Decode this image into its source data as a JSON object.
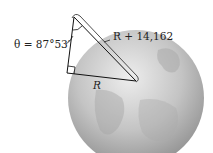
{
  "diagram": {
    "angle_label": "θ = 87°53′",
    "hypotenuse_label": "R + 14,162",
    "radius_label": "R",
    "colors": {
      "globe_light": "#e6e6e6",
      "globe_mid": "#b5b5b5",
      "globe_dark": "#8a8a8a",
      "line": "#111111",
      "background": "#ffffff"
    }
  }
}
